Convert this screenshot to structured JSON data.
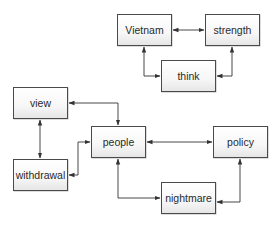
{
  "diagram": {
    "type": "concept-map",
    "nodes": [
      {
        "id": "vietnam",
        "label": "Vietnam",
        "x": 117,
        "y": 14,
        "w": 55,
        "h": 32
      },
      {
        "id": "strength",
        "label": "strength",
        "x": 205,
        "y": 14,
        "w": 55,
        "h": 32
      },
      {
        "id": "think",
        "label": "think",
        "x": 161,
        "y": 60,
        "w": 55,
        "h": 32
      },
      {
        "id": "view",
        "label": "view",
        "x": 13,
        "y": 87,
        "w": 55,
        "h": 32
      },
      {
        "id": "people",
        "label": "people",
        "x": 91,
        "y": 126,
        "w": 55,
        "h": 32
      },
      {
        "id": "policy",
        "label": "policy",
        "x": 213,
        "y": 126,
        "w": 55,
        "h": 32
      },
      {
        "id": "withdrawal",
        "label": "withdrawal",
        "x": 13,
        "y": 159,
        "w": 55,
        "h": 32
      },
      {
        "id": "nightmare",
        "label": "nightmare",
        "x": 161,
        "y": 182,
        "w": 55,
        "h": 32
      }
    ],
    "edges": [
      {
        "from": "vietnam",
        "to": "strength",
        "bidirectional": true
      },
      {
        "from": "vietnam",
        "to": "think",
        "bidirectional": true
      },
      {
        "from": "strength",
        "to": "think",
        "bidirectional": true
      },
      {
        "from": "view",
        "to": "people",
        "bidirectional": true
      },
      {
        "from": "view",
        "to": "withdrawal",
        "bidirectional": true
      },
      {
        "from": "withdrawal",
        "to": "people",
        "bidirectional": true
      },
      {
        "from": "people",
        "to": "policy",
        "bidirectional": true
      },
      {
        "from": "people",
        "to": "nightmare",
        "bidirectional": true
      },
      {
        "from": "policy",
        "to": "nightmare",
        "bidirectional": true
      }
    ],
    "colors": {
      "border": "#4a4a4a",
      "edge": "#333333",
      "text": "#2a2a2a"
    }
  }
}
